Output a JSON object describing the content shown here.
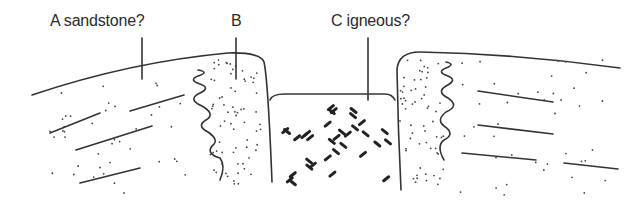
{
  "diagram": {
    "type": "geological cross-section",
    "labels": {
      "a": "A sandstone?",
      "b": "B",
      "c": "C igneous?"
    },
    "colors": {
      "line": "#333333",
      "background": "#ffffff"
    }
  }
}
